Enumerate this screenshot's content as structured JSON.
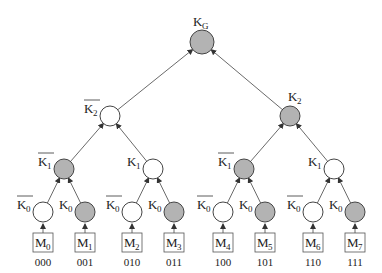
{
  "diagram": {
    "type": "binary key tree",
    "colors": {
      "filled": "#b3b3b3",
      "empty": "#ffffff",
      "stroke": "#444444",
      "edge": "#444444"
    },
    "root": {
      "label": "K",
      "sub": "G",
      "x": 202,
      "y": 42,
      "r": 12,
      "filled": true
    },
    "nodes": [
      {
        "id": "L2a",
        "label": "K",
        "sub": "2",
        "bar": true,
        "x": 110,
        "y": 116,
        "filled": false,
        "parent": "root",
        "label_side": "left"
      },
      {
        "id": "L2b",
        "label": "K",
        "sub": "2",
        "bar": false,
        "x": 290,
        "y": 116,
        "filled": true,
        "parent": "root",
        "label_side": "right"
      },
      {
        "id": "L1a",
        "label": "K",
        "sub": "1",
        "bar": true,
        "x": 64,
        "y": 169,
        "filled": true,
        "parent": "L2a",
        "label_side": "left"
      },
      {
        "id": "L1b",
        "label": "K",
        "sub": "1",
        "bar": false,
        "x": 153,
        "y": 169,
        "filled": false,
        "parent": "L2a",
        "label_side": "left"
      },
      {
        "id": "L1c",
        "label": "K",
        "sub": "1",
        "bar": true,
        "x": 244,
        "y": 169,
        "filled": true,
        "parent": "L2b",
        "label_side": "left"
      },
      {
        "id": "L1d",
        "label": "K",
        "sub": "1",
        "bar": false,
        "x": 334,
        "y": 169,
        "filled": false,
        "parent": "L2b",
        "label_side": "left"
      },
      {
        "id": "L0a",
        "label": "K",
        "sub": "0",
        "bar": true,
        "x": 43,
        "y": 212,
        "filled": false,
        "parent": "L1a",
        "label_side": "left"
      },
      {
        "id": "L0b",
        "label": "K",
        "sub": "0",
        "bar": false,
        "x": 85,
        "y": 212,
        "filled": true,
        "parent": "L1a",
        "label_side": "left"
      },
      {
        "id": "L0c",
        "label": "K",
        "sub": "0",
        "bar": true,
        "x": 132,
        "y": 212,
        "filled": false,
        "parent": "L1b",
        "label_side": "left"
      },
      {
        "id": "L0d",
        "label": "K",
        "sub": "0",
        "bar": false,
        "x": 174,
        "y": 212,
        "filled": true,
        "parent": "L1b",
        "label_side": "left"
      },
      {
        "id": "L0e",
        "label": "K",
        "sub": "0",
        "bar": true,
        "x": 223,
        "y": 212,
        "filled": false,
        "parent": "L1c",
        "label_side": "left"
      },
      {
        "id": "L0f",
        "label": "K",
        "sub": "0",
        "bar": false,
        "x": 265,
        "y": 212,
        "filled": true,
        "parent": "L1c",
        "label_side": "left"
      },
      {
        "id": "L0g",
        "label": "K",
        "sub": "0",
        "bar": true,
        "x": 313,
        "y": 212,
        "filled": false,
        "parent": "L1d",
        "label_side": "left"
      },
      {
        "id": "L0h",
        "label": "K",
        "sub": "0",
        "bar": false,
        "x": 355,
        "y": 212,
        "filled": true,
        "parent": "L1d",
        "label_side": "left"
      }
    ],
    "messages": [
      {
        "label": "M",
        "sub": "0",
        "code": "000",
        "x": 43
      },
      {
        "label": "M",
        "sub": "1",
        "code": "001",
        "x": 85
      },
      {
        "label": "M",
        "sub": "2",
        "code": "010",
        "x": 132
      },
      {
        "label": "M",
        "sub": "3",
        "code": "011",
        "x": 174
      },
      {
        "label": "M",
        "sub": "4",
        "code": "100",
        "x": 223
      },
      {
        "label": "M",
        "sub": "5",
        "code": "101",
        "x": 265
      },
      {
        "label": "M",
        "sub": "6",
        "code": "110",
        "x": 313
      },
      {
        "label": "M",
        "sub": "7",
        "code": "111",
        "x": 355
      }
    ]
  }
}
